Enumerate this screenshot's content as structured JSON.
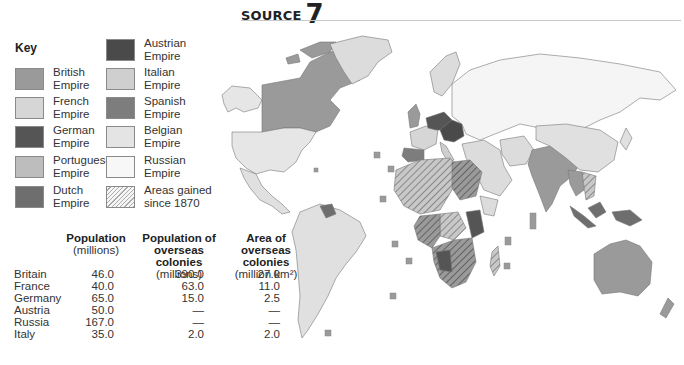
{
  "header": {
    "label": "SOURCE",
    "number": "7"
  },
  "key": {
    "title": "Key",
    "items": [
      {
        "id": "british",
        "line1": "British",
        "line2": "Empire",
        "color": "#9a9a9a"
      },
      {
        "id": "french",
        "line1": "French",
        "line2": "Empire",
        "color": "#d6d6d6"
      },
      {
        "id": "german",
        "line1": "German",
        "line2": "Empire",
        "color": "#555555"
      },
      {
        "id": "portuguese",
        "line1": "Portuguese",
        "line2": "Empire",
        "color": "#bdbdbd"
      },
      {
        "id": "dutch",
        "line1": "Dutch",
        "line2": "Empire",
        "color": "#6e6e6e"
      },
      {
        "id": "austrian",
        "line1": "Austrian",
        "line2": "Empire",
        "color": "#4a4a4a"
      },
      {
        "id": "italian",
        "line1": "Italian",
        "line2": "Empire",
        "color": "#cfcfcf"
      },
      {
        "id": "spanish",
        "line1": "Spanish",
        "line2": "Empire",
        "color": "#7d7d7d"
      },
      {
        "id": "belgian",
        "line1": "Belgian",
        "line2": "Empire",
        "color": "#e4e4e4"
      },
      {
        "id": "russian",
        "line1": "Russian",
        "line2": "Empire",
        "color": "#f5f5f5"
      },
      {
        "id": "gained",
        "line1": "Areas gained",
        "line2": "since 1870",
        "color": "hatched"
      }
    ]
  },
  "table": {
    "headers": [
      {
        "bold": "Population",
        "sub": "(millions)"
      },
      {
        "bold": "Population of overseas colonies",
        "sub": "(millions)"
      },
      {
        "bold": "Area of overseas colonies",
        "sub": "(million km²)"
      }
    ],
    "rows": [
      {
        "country": "Britain",
        "population": "46.0",
        "colony_population": "390.0",
        "colony_area": "27.0"
      },
      {
        "country": "France",
        "population": "40.0",
        "colony_population": "63.0",
        "colony_area": "11.0"
      },
      {
        "country": "Germany",
        "population": "65.0",
        "colony_population": "15.0",
        "colony_area": "2.5"
      },
      {
        "country": "Austria",
        "population": "50.0",
        "colony_population": "—",
        "colony_area": "—"
      },
      {
        "country": "Russia",
        "population": "167.0",
        "colony_population": "—",
        "colony_area": "—"
      },
      {
        "country": "Italy",
        "population": "35.0",
        "colony_population": "2.0",
        "colony_area": "2.0"
      }
    ]
  },
  "map": {
    "title": "World empires map",
    "colors": {
      "british": "#9a9a9a",
      "french": "#d6d6d6",
      "german": "#555555",
      "portuguese": "#bdbdbd",
      "dutch": "#6e6e6e",
      "austrian": "#4a4a4a",
      "italian": "#cfcfcf",
      "spanish": "#7d7d7d",
      "belgian": "#e4e4e4",
      "russian": "#f5f5f5",
      "other": "#d9d9d9",
      "border": "#777777"
    }
  }
}
